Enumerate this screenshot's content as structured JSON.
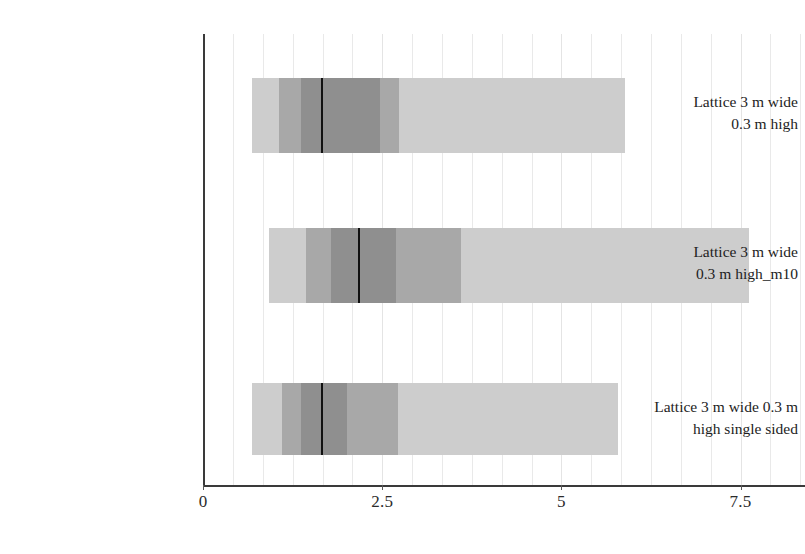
{
  "chart_data": {
    "type": "bar",
    "title": "",
    "xlabel": "",
    "ylabel": "",
    "orientation": "horizontal",
    "grid": true,
    "legend": "none",
    "xlim": [
      0,
      8.4
    ],
    "xticks": [
      0,
      2.5,
      5,
      7.5
    ],
    "xticklabels": [
      "0",
      "2.5",
      "5",
      "7.5"
    ],
    "minor_gridline_step": 0.4167,
    "categories": [
      "Lattice 3 m wide 0.3 m high",
      "Lattice 3 m wide 0.3 m high_m10",
      "Lattice 3 m wide 0.3 m high single sided"
    ],
    "band_colors": [
      "#cdcdcd",
      "#a8a8a8",
      "#8f8f8f"
    ],
    "median_color": "#111111",
    "series": [
      {
        "name": "whisker-low-to-high",
        "values": [
          [
            0.68,
            5.89
          ],
          [
            0.92,
            7.62
          ],
          [
            0.68,
            5.79
          ]
        ]
      },
      {
        "name": "mid-band",
        "values": [
          [
            1.06,
            2.73
          ],
          [
            1.44,
            3.6
          ],
          [
            1.1,
            2.72
          ]
        ]
      },
      {
        "name": "inner-band",
        "values": [
          [
            1.37,
            2.47
          ],
          [
            1.79,
            2.69
          ],
          [
            1.37,
            2.01
          ]
        ]
      },
      {
        "name": "median",
        "values": [
          1.65,
          2.16,
          1.65
        ]
      }
    ],
    "boxes": [
      {
        "category": "Lattice 3 m wide 0.3 m high",
        "low": 0.68,
        "q_outer_low": 1.06,
        "q_inner_low": 1.37,
        "median": 1.65,
        "q_inner_high": 2.47,
        "q_outer_high": 2.73,
        "high": 5.89
      },
      {
        "category": "Lattice 3 m wide 0.3 m high_m10",
        "low": 0.92,
        "q_outer_low": 1.44,
        "q_inner_low": 1.79,
        "median": 2.16,
        "q_inner_high": 2.69,
        "q_outer_high": 3.6,
        "high": 7.62
      },
      {
        "category": "Lattice 3 m wide 0.3 m high single sided",
        "low": 0.68,
        "q_outer_low": 1.1,
        "q_inner_low": 1.37,
        "median": 1.65,
        "q_inner_high": 2.01,
        "q_outer_high": 2.72,
        "high": 5.79
      }
    ]
  },
  "axis": {
    "x_ticks": [
      {
        "label": "0",
        "value": 0
      },
      {
        "label": "2.5",
        "value": 2.5
      },
      {
        "label": "5",
        "value": 5
      },
      {
        "label": "7.5",
        "value": 7.5
      }
    ]
  },
  "categories": [
    {
      "id": "lattice-3m-03m-high",
      "line1": "Lattice 3 m wide",
      "line2": "0.3 m high"
    },
    {
      "id": "lattice-3m-03m-high-m10",
      "line1": "Lattice 3 m wide",
      "line2": "0.3 m high_m10"
    },
    {
      "id": "lattice-3m-03m-high-single-sided",
      "line1": "Lattice 3 m wide 0.3 m",
      "line2": "high single sided"
    }
  ]
}
